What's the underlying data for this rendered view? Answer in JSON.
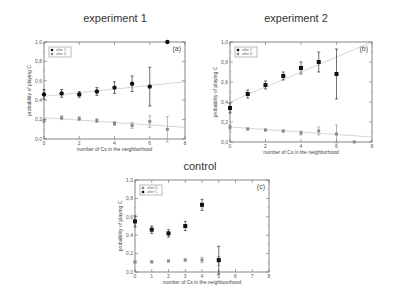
{
  "titles": {
    "panel_a": "experiment 1",
    "panel_b": "experiment 2",
    "panel_c": "control"
  },
  "chart_data": [
    {
      "type": "scatter",
      "title": "experiment 1",
      "panel_label": "(a)",
      "xlabel": "number of Cs in the neighborhood",
      "ylabel": "probability of playing C",
      "xlim": [
        0,
        8
      ],
      "ylim": [
        0.0,
        1.0
      ],
      "xticks": [
        "0",
        "2",
        "4",
        "6",
        "8"
      ],
      "yticks": [
        "0,0",
        "0,2",
        "0,4",
        "0,6",
        "0,8",
        "1,0"
      ],
      "legend": [
        "after C",
        "after D"
      ],
      "series": [
        {
          "name": "after C",
          "marker": "filled-circle",
          "x": [
            0,
            1,
            2,
            3,
            4,
            5,
            6,
            7
          ],
          "y": [
            0.46,
            0.47,
            0.46,
            0.49,
            0.53,
            0.57,
            0.54,
            1.0
          ],
          "err": [
            0.05,
            0.04,
            0.03,
            0.04,
            0.06,
            0.08,
            0.2,
            0.0
          ],
          "fit": [
            [
              0,
              0.44
            ],
            [
              8,
              0.59
            ]
          ]
        },
        {
          "name": "after D",
          "marker": "gray-square",
          "x": [
            0,
            1,
            2,
            3,
            4,
            5,
            6,
            7
          ],
          "y": [
            0.19,
            0.22,
            0.21,
            0.19,
            0.16,
            0.14,
            0.18,
            0.1
          ],
          "err": [
            0.02,
            0.02,
            0.02,
            0.02,
            0.02,
            0.03,
            0.06,
            0.13
          ],
          "fit": [
            [
              0,
              0.22
            ],
            [
              8,
              0.12
            ]
          ]
        }
      ]
    },
    {
      "type": "scatter",
      "title": "experiment 2",
      "panel_label": "(b)",
      "xlabel": "number of Cs in the neighborhood",
      "ylabel": "probability of playing C",
      "xlim": [
        0,
        8
      ],
      "ylim": [
        0.0,
        1.0
      ],
      "xticks": [
        "0",
        "2",
        "4",
        "6",
        "8"
      ],
      "yticks": [
        "0,0",
        "0,2",
        "0,4",
        "0,6",
        "0,8",
        "1,0"
      ],
      "legend": [
        "after C",
        "after D"
      ],
      "series": [
        {
          "name": "after C",
          "marker": "filled-square",
          "x": [
            0,
            1,
            2,
            3,
            4,
            5,
            6
          ],
          "y": [
            0.34,
            0.48,
            0.57,
            0.66,
            0.74,
            0.8,
            0.68
          ],
          "err": [
            0.05,
            0.04,
            0.04,
            0.04,
            0.06,
            0.1,
            0.25
          ],
          "fit": [
            [
              0,
              0.4
            ],
            [
              8,
              1.0
            ]
          ]
        },
        {
          "name": "after D",
          "marker": "gray-square",
          "x": [
            0,
            1,
            2,
            3,
            4,
            5,
            6,
            7
          ],
          "y": [
            0.15,
            0.13,
            0.12,
            0.11,
            0.09,
            0.11,
            0.08,
            0.0
          ],
          "err": [
            0.02,
            0.01,
            0.01,
            0.01,
            0.02,
            0.04,
            0.09,
            0.0
          ],
          "fit": [
            [
              0,
              0.15
            ],
            [
              8,
              0.05
            ]
          ]
        }
      ]
    },
    {
      "type": "scatter",
      "title": "control",
      "panel_label": "(c)",
      "xlabel": "number of Cs in the neighbourhood",
      "ylabel": "probability of playing C",
      "xlim": [
        0,
        8
      ],
      "ylim": [
        0.0,
        1.0
      ],
      "xticks": [
        "0",
        "1",
        "2",
        "3",
        "4",
        "5",
        "6",
        "7",
        "8"
      ],
      "yticks": [
        "0,0",
        "0,2",
        "0,4",
        "0,6",
        "0,8",
        "1,0"
      ],
      "legend": [
        "after D",
        "after C"
      ],
      "series": [
        {
          "name": "after D",
          "marker": "gray-square",
          "x": [
            0,
            1,
            2,
            3,
            4,
            5
          ],
          "y": [
            0.11,
            0.11,
            0.12,
            0.13,
            0.13,
            0.12
          ],
          "err": [
            0.01,
            0.01,
            0.01,
            0.01,
            0.03,
            0.05
          ],
          "fit": null
        },
        {
          "name": "after C",
          "marker": "filled-square",
          "x": [
            0,
            1,
            2,
            3,
            4,
            5
          ],
          "y": [
            0.55,
            0.46,
            0.42,
            0.5,
            0.73,
            0.13
          ],
          "err": [
            0.06,
            0.04,
            0.04,
            0.05,
            0.06,
            0.15
          ],
          "fit": null
        }
      ]
    }
  ],
  "layout": {
    "panels": [
      {
        "left": 44,
        "top": 42,
        "right": 185,
        "bottom": 139,
        "title_x": 115,
        "title_y": 12
      },
      {
        "left": 230,
        "top": 42,
        "right": 372,
        "bottom": 142,
        "title_x": 296,
        "title_y": 12
      },
      {
        "left": 135,
        "top": 180,
        "right": 269,
        "bottom": 272,
        "title_x": 200,
        "title_y": 160
      }
    ]
  }
}
